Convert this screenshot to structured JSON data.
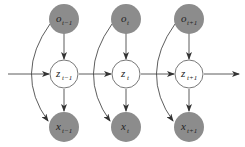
{
  "diagram": {
    "type": "graphical-model",
    "colors": {
      "observed_fill": "#8c8c8c",
      "latent_fill": "#ffffff",
      "stroke": "#555555",
      "edge": "#333333"
    },
    "columns": [
      {
        "o": {
          "base": "o",
          "sub": "t−1"
        },
        "z": {
          "base": "z",
          "sub": "t−1"
        },
        "x": {
          "base": "x",
          "sub": "t−1"
        }
      },
      {
        "o": {
          "base": "o",
          "sub": "t"
        },
        "z": {
          "base": "z",
          "sub": "t"
        },
        "x": {
          "base": "x",
          "sub": "t"
        }
      },
      {
        "o": {
          "base": "o",
          "sub": "t+1"
        },
        "z": {
          "base": "z",
          "sub": "t+1"
        },
        "x": {
          "base": "x",
          "sub": "t+1"
        }
      }
    ],
    "edges": [
      "o→z",
      "z→x",
      "o→x (curved)",
      "z(t)→z(t+1)"
    ]
  }
}
